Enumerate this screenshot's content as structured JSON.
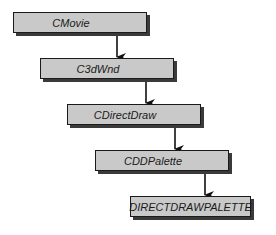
{
  "diagram": {
    "type": "class-hierarchy",
    "nodes": [
      {
        "id": "cmovie",
        "label": "CMovie"
      },
      {
        "id": "c3dwnd",
        "label": "C3dWnd"
      },
      {
        "id": "cdirectdraw",
        "label": "CDirectDraw"
      },
      {
        "id": "cddpalette",
        "label": "CDDPalette"
      },
      {
        "id": "directdrawpalette",
        "label": "DIRECTDRAWPALETTE"
      }
    ],
    "edges": [
      {
        "from": "cmovie",
        "to": "c3dwnd"
      },
      {
        "from": "c3dwnd",
        "to": "cdirectdraw"
      },
      {
        "from": "cdirectdraw",
        "to": "cddpalette"
      },
      {
        "from": "cddpalette",
        "to": "directdrawpalette"
      }
    ]
  }
}
